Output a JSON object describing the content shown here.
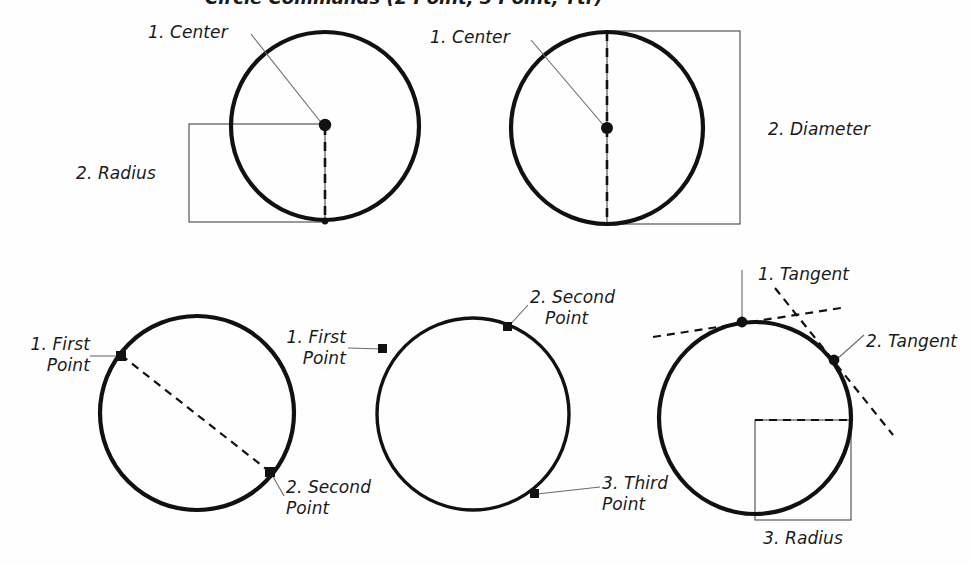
{
  "figure": {
    "caption": "Circle Commands (2 Point, 3 Point, Ttr)",
    "background_color": "#fefefe",
    "ink_color": "#111111",
    "leader_color": "#6a6a6a",
    "bracket_color": "#555555"
  },
  "diagrams": [
    {
      "id": "center-radius",
      "name": "Center, Radius",
      "labels": {
        "step1": "1. Center",
        "step2": "2. Radius"
      }
    },
    {
      "id": "center-diameter",
      "name": "Center, Diameter",
      "labels": {
        "step1": "1. Center",
        "step2": "2. Diameter"
      }
    },
    {
      "id": "two-point",
      "name": "2 Point",
      "labels": {
        "step1_line1": "1. First",
        "step1_line2": "Point",
        "step2_line1": "2. Second",
        "step2_line2": "Point"
      }
    },
    {
      "id": "three-point",
      "name": "3 Point",
      "labels": {
        "step1_line1": "1. First",
        "step1_line2": "Point",
        "step2_line1": "2. Second",
        "step2_line2": "Point",
        "step3_line1": "3. Third",
        "step3_line2": "Point"
      }
    },
    {
      "id": "tangent-tangent-radius",
      "name": "Tangent, Tangent, Radius",
      "labels": {
        "step1": "1. Tangent",
        "step2": "2. Tangent",
        "step3": "3. Radius"
      }
    }
  ],
  "geometry": {
    "circle1": {
      "cx": 325,
      "cy": 126,
      "r": 94
    },
    "circle2": {
      "cx": 607,
      "cy": 128,
      "r": 96
    },
    "circle3": {
      "cx": 197,
      "cy": 413,
      "r": 97
    },
    "circle4": {
      "cx": 473,
      "cy": 414,
      "r": 96
    },
    "circle5": {
      "cx": 755,
      "cy": 418,
      "r": 96
    }
  }
}
